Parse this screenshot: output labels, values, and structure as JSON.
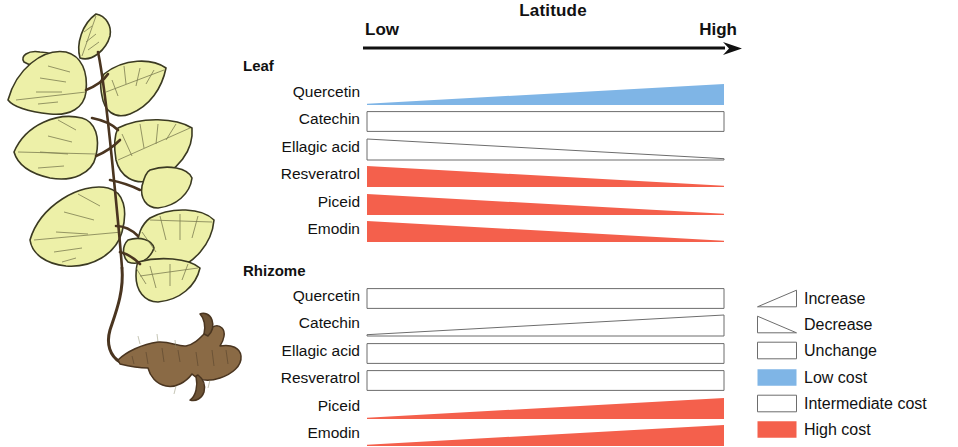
{
  "axis": {
    "title": "Latitude",
    "low_label": "Low",
    "high_label": "High",
    "arrow_direction": "right"
  },
  "colors": {
    "low_cost_blue": "#7FB5E6",
    "high_cost_red": "#F4604C",
    "intermediate_outline": "#6d6d6d",
    "text": "#111111",
    "leaf_fill": "#EDF0A8",
    "leaf_outline": "#3b3a22",
    "rhizome_fill": "#8a6a45",
    "rhizome_outline": "#4a3520"
  },
  "illustration": {
    "name": "japanese-knotweed-plant",
    "parts": [
      "leaves",
      "stem",
      "rhizome"
    ]
  },
  "groups": [
    {
      "title": "Leaf",
      "rows": [
        {
          "label": "Quercetin",
          "trend": "increase",
          "cost": "low",
          "fill": "#7FB5E6",
          "outlined": false
        },
        {
          "label": "Catechin",
          "trend": "unchange",
          "cost": "intermediate",
          "fill": "none",
          "outlined": true
        },
        {
          "label": "Ellagic acid",
          "trend": "decrease",
          "cost": "intermediate",
          "fill": "none",
          "outlined": true
        },
        {
          "label": "Resveratrol",
          "trend": "decrease",
          "cost": "high",
          "fill": "#F4604C",
          "outlined": false
        },
        {
          "label": "Piceid",
          "trend": "decrease",
          "cost": "high",
          "fill": "#F4604C",
          "outlined": false
        },
        {
          "label": "Emodin",
          "trend": "decrease",
          "cost": "high",
          "fill": "#F4604C",
          "outlined": false
        }
      ]
    },
    {
      "title": "Rhizome",
      "rows": [
        {
          "label": "Quercetin",
          "trend": "unchange",
          "cost": "intermediate",
          "fill": "none",
          "outlined": true
        },
        {
          "label": "Catechin",
          "trend": "increase",
          "cost": "intermediate",
          "fill": "none",
          "outlined": true
        },
        {
          "label": "Ellagic acid",
          "trend": "unchange",
          "cost": "intermediate",
          "fill": "none",
          "outlined": true
        },
        {
          "label": "Resveratrol",
          "trend": "unchange",
          "cost": "intermediate",
          "fill": "none",
          "outlined": true
        },
        {
          "label": "Piceid",
          "trend": "increase",
          "cost": "high",
          "fill": "#F4604C",
          "outlined": false
        },
        {
          "label": "Emodin",
          "trend": "increase",
          "cost": "high",
          "fill": "#F4604C",
          "outlined": false
        }
      ]
    }
  ],
  "legend": {
    "items": [
      {
        "label": "Increase",
        "icon": "increase-triangle-icon",
        "shape": "increase",
        "fill": "none",
        "outlined": true
      },
      {
        "label": "Decrease",
        "icon": "decrease-triangle-icon",
        "shape": "decrease",
        "fill": "none",
        "outlined": true
      },
      {
        "label": "Unchange",
        "icon": "unchange-rectangle-icon",
        "shape": "rect",
        "fill": "none",
        "outlined": true
      },
      {
        "label": "Low cost",
        "icon": "low-cost-swatch-icon",
        "shape": "rect",
        "fill": "#7FB5E6",
        "outlined": false
      },
      {
        "label": "Intermediate cost",
        "icon": "intermediate-cost-swatch-icon",
        "shape": "rect",
        "fill": "none",
        "outlined": true
      },
      {
        "label": "High cost",
        "icon": "high-cost-swatch-icon",
        "shape": "rect",
        "fill": "#F4604C",
        "outlined": false
      }
    ]
  },
  "chart_data": {
    "type": "bar",
    "xlabel": "Latitude",
    "ylabel": "",
    "x_axis": {
      "from": "Low",
      "to": "High",
      "arrow": true
    },
    "encoding": {
      "shape": {
        "increase": "wedge widening left-to-right",
        "decrease": "wedge narrowing left-to-right",
        "unchange": "constant-height rectangle"
      },
      "color": {
        "Low cost": "#7FB5E6",
        "Intermediate cost": "white with outline",
        "High cost": "#F4604C"
      }
    },
    "series": [
      {
        "name": "Leaf Quercetin",
        "tissue": "Leaf",
        "compound": "Quercetin",
        "trend": "increase",
        "cost": "Low cost",
        "start": 0.12,
        "end": 1.0
      },
      {
        "name": "Leaf Catechin",
        "tissue": "Leaf",
        "compound": "Catechin",
        "trend": "unchange",
        "cost": "Intermediate cost",
        "start": 1.0,
        "end": 1.0
      },
      {
        "name": "Leaf Ellagic acid",
        "tissue": "Leaf",
        "compound": "Ellagic acid",
        "trend": "decrease",
        "cost": "Intermediate cost",
        "start": 1.0,
        "end": 0.03
      },
      {
        "name": "Leaf Resveratrol",
        "tissue": "Leaf",
        "compound": "Resveratrol",
        "trend": "decrease",
        "cost": "High cost",
        "start": 1.0,
        "end": 0.07
      },
      {
        "name": "Leaf Piceid",
        "tissue": "Leaf",
        "compound": "Piceid",
        "trend": "decrease",
        "cost": "High cost",
        "start": 1.0,
        "end": 0.07
      },
      {
        "name": "Leaf Emodin",
        "tissue": "Leaf",
        "compound": "Emodin",
        "trend": "decrease",
        "cost": "High cost",
        "start": 1.0,
        "end": 0.07
      },
      {
        "name": "Rhizome Quercetin",
        "tissue": "Rhizome",
        "compound": "Quercetin",
        "trend": "unchange",
        "cost": "Intermediate cost",
        "start": 1.0,
        "end": 1.0
      },
      {
        "name": "Rhizome Catechin",
        "tissue": "Rhizome",
        "compound": "Catechin",
        "trend": "increase",
        "cost": "Intermediate cost",
        "start": 0.05,
        "end": 1.0
      },
      {
        "name": "Rhizome Ellagic acid",
        "tissue": "Rhizome",
        "compound": "Ellagic acid",
        "trend": "unchange",
        "cost": "Intermediate cost",
        "start": 1.0,
        "end": 1.0
      },
      {
        "name": "Rhizome Resveratrol",
        "tissue": "Rhizome",
        "compound": "Resveratrol",
        "trend": "unchange",
        "cost": "Intermediate cost",
        "start": 1.0,
        "end": 1.0
      },
      {
        "name": "Rhizome Piceid",
        "tissue": "Rhizome",
        "compound": "Piceid",
        "trend": "increase",
        "cost": "High cost",
        "start": 0.07,
        "end": 1.0
      },
      {
        "name": "Rhizome Emodin",
        "tissue": "Rhizome",
        "compound": "Emodin",
        "trend": "increase",
        "cost": "High cost",
        "start": 0.07,
        "end": 1.0
      }
    ],
    "legend_position": "bottom-right",
    "grid": false
  }
}
